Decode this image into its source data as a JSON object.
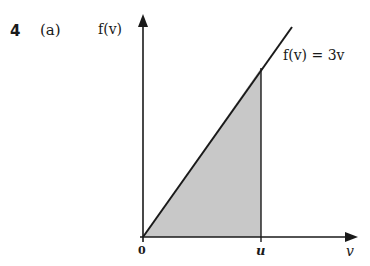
{
  "question": {
    "number": "4",
    "part": "(a)"
  },
  "diagram": {
    "y_axis_label": "f(v)",
    "x_axis_label": "v",
    "origin_label": "0",
    "u_label": "u",
    "function_label": "f(v) = 3v",
    "shaded_region": "area under f(v)=3v from 0 to u",
    "colors": {
      "line": "#1a1a1a",
      "shade": "#c8c8c8"
    }
  }
}
